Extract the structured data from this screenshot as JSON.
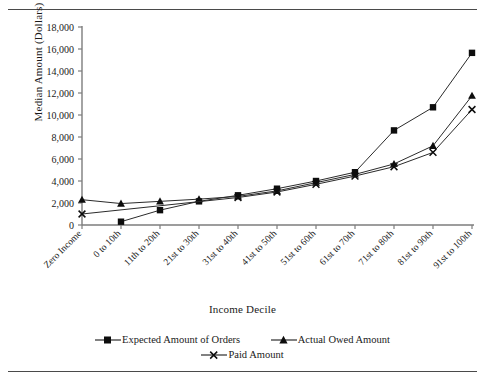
{
  "chart_data": {
    "type": "line",
    "title": "",
    "xlabel": "Income Decile",
    "ylabel": "Median Amount (Dollars)",
    "categories": [
      "Zero Income",
      "0 to 10th",
      "11th to 20th",
      "21st to 30th",
      "31st to 40th",
      "41st to 50th",
      "51st to 60th",
      "61st to 70th",
      "71st to 80th",
      "81st to 90th",
      "91st to 100th"
    ],
    "ylim": [
      0,
      18000
    ],
    "yticks": [
      0,
      2000,
      4000,
      6000,
      8000,
      10000,
      12000,
      14000,
      16000,
      18000
    ],
    "ytick_labels": [
      "0",
      "2,000",
      "4,000",
      "6,000",
      "8,000",
      "10,000",
      "12,000",
      "14,000",
      "16,000",
      "18,000"
    ],
    "grid": false,
    "legend_position": "bottom",
    "series": [
      {
        "name": "Expected Amount of Orders",
        "marker": "square",
        "values": [
          null,
          300,
          1350,
          2150,
          2700,
          3300,
          4000,
          4800,
          8600,
          10700,
          15650
        ]
      },
      {
        "name": "Actual Owed Amount",
        "marker": "triangle",
        "values": [
          2300,
          1950,
          2150,
          2350,
          2600,
          3100,
          3850,
          4600,
          5550,
          7200,
          11750
        ]
      },
      {
        "name": "Paid Amount",
        "marker": "x",
        "values": [
          1000,
          null,
          null,
          null,
          2500,
          3000,
          3700,
          4450,
          5300,
          6600,
          10500
        ]
      }
    ]
  },
  "axis": {
    "ylabel": "Median Amount (Dollars)",
    "xlabel": "Income Decile"
  },
  "legend": {
    "items": [
      {
        "label": "Expected Amount of Orders",
        "marker": "square"
      },
      {
        "label": "Actual Owed Amount",
        "marker": "triangle"
      },
      {
        "label": "Paid Amount",
        "marker": "x"
      }
    ]
  }
}
